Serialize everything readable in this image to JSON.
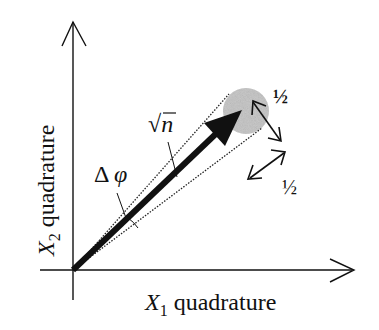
{
  "diagram": {
    "type": "phasor-diagram",
    "x_axis_label": {
      "var": "X",
      "sub": "1",
      "text": "quadrature"
    },
    "y_axis_label": {
      "var": "X",
      "sub": "2",
      "text": "quadrature"
    },
    "amplitude_label": "√n̄",
    "phase_label": "Δφ",
    "uncertainty_labels": [
      "½",
      "½"
    ],
    "colors": {
      "ink": "#111111",
      "noise_disc": "#bdbdbd",
      "background": "#ffffff"
    }
  }
}
